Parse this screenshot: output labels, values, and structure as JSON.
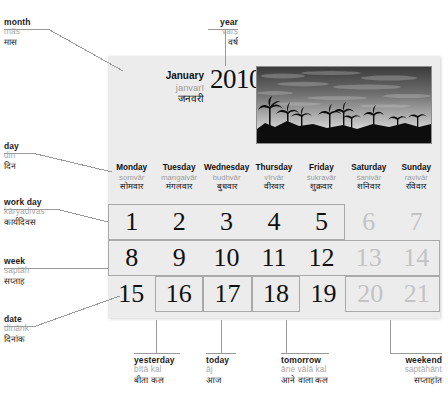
{
  "calendar": {
    "month": {
      "en": "January",
      "translit": "janvarī",
      "hindi": "जनवरी"
    },
    "year": "2010",
    "photo_alt": "sunset-palm-trees-photo",
    "weekdays": [
      {
        "en": "Monday",
        "translit": "somvār",
        "hindi": "सोमवार"
      },
      {
        "en": "Tuesday",
        "translit": "mangalvār",
        "hindi": "मंगलवार"
      },
      {
        "en": "Wednesday",
        "translit": "budhvār",
        "hindi": "बुधवार"
      },
      {
        "en": "Thursday",
        "translit": "vīrvār",
        "hindi": "वीरवार"
      },
      {
        "en": "Friday",
        "translit": "śukravār",
        "hindi": "शुक्रवार"
      },
      {
        "en": "Saturday",
        "translit": "śanivār",
        "hindi": "शनिवार"
      },
      {
        "en": "Sunday",
        "translit": "ravivār",
        "hindi": "रविवार"
      }
    ],
    "rows": [
      [
        {
          "n": "1",
          "weekend": false,
          "boxed": false
        },
        {
          "n": "2",
          "weekend": false,
          "boxed": false
        },
        {
          "n": "3",
          "weekend": false,
          "boxed": false
        },
        {
          "n": "4",
          "weekend": false,
          "boxed": false
        },
        {
          "n": "5",
          "weekend": false,
          "boxed": false
        },
        {
          "n": "6",
          "weekend": true,
          "boxed": false
        },
        {
          "n": "7",
          "weekend": true,
          "boxed": false
        }
      ],
      [
        {
          "n": "8",
          "weekend": false,
          "boxed": false
        },
        {
          "n": "9",
          "weekend": false,
          "boxed": false
        },
        {
          "n": "10",
          "weekend": false,
          "boxed": false
        },
        {
          "n": "11",
          "weekend": false,
          "boxed": false
        },
        {
          "n": "12",
          "weekend": false,
          "boxed": false
        },
        {
          "n": "13",
          "weekend": true,
          "boxed": false
        },
        {
          "n": "14",
          "weekend": true,
          "boxed": false
        }
      ],
      [
        {
          "n": "15",
          "weekend": false,
          "boxed": false
        },
        {
          "n": "16",
          "weekend": false,
          "boxed": true
        },
        {
          "n": "17",
          "weekend": false,
          "boxed": true
        },
        {
          "n": "18",
          "weekend": false,
          "boxed": true
        },
        {
          "n": "19",
          "weekend": false,
          "boxed": false
        },
        {
          "n": "20",
          "weekend": true,
          "boxed": false
        },
        {
          "n": "21",
          "weekend": true,
          "boxed": false
        }
      ]
    ]
  },
  "annotations": {
    "month": {
      "en": "month",
      "translit": "mās",
      "hindi": "मास"
    },
    "year": {
      "en": "year",
      "translit": "varṣ",
      "hindi": "वर्ष"
    },
    "day": {
      "en": "day",
      "translit": "din",
      "hindi": "दिन"
    },
    "work_day": {
      "en": "work day",
      "translit": "kāryadivas",
      "hindi": "कार्यदिवस"
    },
    "week": {
      "en": "week",
      "translit": "saptāh",
      "hindi": "सप्ताह"
    },
    "date": {
      "en": "date",
      "translit": "dinānk",
      "hindi": "दिनांक"
    },
    "yesterday": {
      "en": "yesterday",
      "translit": "bītā kal",
      "hindi": "बीता कल"
    },
    "today": {
      "en": "today",
      "translit": "āj",
      "hindi": "आज"
    },
    "tomorrow": {
      "en": "tomorrow",
      "translit": "āne vālā kal",
      "hindi": "आने वाला कल"
    },
    "weekend": {
      "en": "weekend",
      "translit": "saptāhānt",
      "hindi": "सप्ताहांत"
    }
  },
  "colors": {
    "card_bg": "#ececec",
    "translit": "#a8a8a8",
    "weekend_number": "#c3c3c3",
    "rule": "#9a9a9a",
    "text": "#111111"
  }
}
